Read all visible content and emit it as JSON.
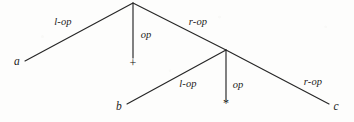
{
  "figure": {
    "kind": "annotated-parse-tree",
    "background_color": "#fdfdfc",
    "ink_color": "#1b1b1b",
    "nodes": [
      {
        "id": "root",
        "name": "root-node",
        "x": 133,
        "y": 3
      },
      {
        "id": "subroot",
        "name": "sub-root-node",
        "x": 226,
        "y": 50
      }
    ],
    "edges": [
      {
        "id": "root-l",
        "name": "root-left-edge",
        "x1": 133,
        "y1": 3,
        "x2": 25,
        "y2": 61
      },
      {
        "id": "root-op",
        "name": "root-op-edge",
        "x1": 133,
        "y1": 3,
        "x2": 133,
        "y2": 58
      },
      {
        "id": "root-r",
        "name": "root-right-edge",
        "x1": 133,
        "y1": 3,
        "x2": 226,
        "y2": 50
      },
      {
        "id": "sub-l",
        "name": "sub-left-edge",
        "x1": 226,
        "y1": 50,
        "x2": 127,
        "y2": 104
      },
      {
        "id": "sub-op",
        "name": "sub-op-edge",
        "x1": 226,
        "y1": 50,
        "x2": 226,
        "y2": 99
      },
      {
        "id": "sub-r",
        "name": "sub-right-edge",
        "x1": 226,
        "y1": 50,
        "x2": 329,
        "y2": 104
      }
    ],
    "edge_labels": [
      {
        "id": "lbl-root-l",
        "name": "edge-label-root-l-op",
        "text": "l-op",
        "x": 63,
        "y": 22
      },
      {
        "id": "lbl-root-op",
        "name": "edge-label-root-op",
        "text": "op",
        "x": 146,
        "y": 35
      },
      {
        "id": "lbl-root-r",
        "name": "edge-label-root-r-op",
        "text": "r-op",
        "x": 198,
        "y": 22
      },
      {
        "id": "lbl-sub-l",
        "name": "edge-label-sub-l-op",
        "text": "l-op",
        "x": 188,
        "y": 84
      },
      {
        "id": "lbl-sub-op",
        "name": "edge-label-sub-op",
        "text": "op",
        "x": 238,
        "y": 85
      },
      {
        "id": "lbl-sub-r",
        "name": "edge-label-sub-r-op",
        "text": "r-op",
        "x": 313,
        "y": 82
      }
    ],
    "leaves": [
      {
        "id": "leaf-a",
        "name": "leaf-a",
        "text": "a",
        "x": 17,
        "y": 62
      },
      {
        "id": "leaf-b",
        "name": "leaf-b",
        "text": "b",
        "x": 119,
        "y": 107
      },
      {
        "id": "leaf-c",
        "name": "leaf-c",
        "text": "c",
        "x": 336,
        "y": 107
      }
    ],
    "operators": [
      {
        "id": "op-plus",
        "name": "operator-plus-symbol",
        "text": "+",
        "x": 133,
        "y": 63
      },
      {
        "id": "op-times",
        "name": "operator-times-symbol",
        "text": "*",
        "x": 226,
        "y": 103
      }
    ]
  }
}
